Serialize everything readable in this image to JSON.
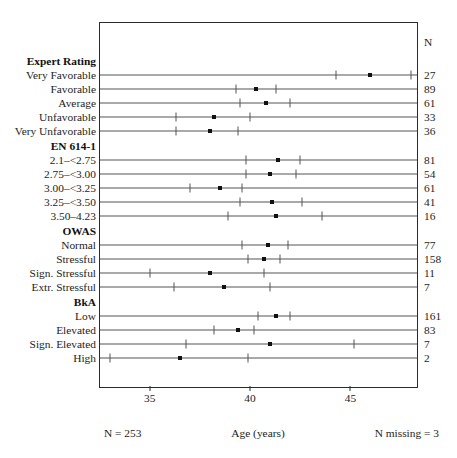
{
  "chart_data": {
    "type": "scatter",
    "title": "",
    "xlabel": "Age (years)",
    "ylabel": "",
    "xlim": [
      32.52,
      48.32
    ],
    "xticks": [
      35,
      40,
      45
    ],
    "xtick_labels": [
      "35",
      "40",
      "45"
    ],
    "grid": false,
    "legend": "none",
    "n_column_header": "N",
    "footer_left": "N = 253",
    "footer_center": "Age (years)",
    "footer_right": "N missing = 3",
    "marker": "point estimate with 95% confidence interval whiskers",
    "groups": [
      {
        "name": "Expert Rating",
        "rows": [
          {
            "label": "Very Favorable",
            "estimate": 46.0,
            "ci_low": 44.3,
            "ci_high": 48.0,
            "n": "27"
          },
          {
            "label": "Favorable",
            "estimate": 40.3,
            "ci_low": 39.3,
            "ci_high": 41.3,
            "n": "89"
          },
          {
            "label": "Average",
            "estimate": 40.8,
            "ci_low": 39.5,
            "ci_high": 42.0,
            "n": "61"
          },
          {
            "label": "Unfavorable",
            "estimate": 38.2,
            "ci_low": 36.3,
            "ci_high": 40.0,
            "n": "33"
          },
          {
            "label": "Very Unfavorable",
            "estimate": 38.0,
            "ci_low": 36.3,
            "ci_high": 39.4,
            "n": "36"
          }
        ]
      },
      {
        "name": "EN 614-1",
        "rows": [
          {
            "label": "2.1–<2.75",
            "estimate": 41.4,
            "ci_low": 39.8,
            "ci_high": 42.5,
            "n": "81"
          },
          {
            "label": "2.75–<3.00",
            "estimate": 41.0,
            "ci_low": 39.8,
            "ci_high": 42.3,
            "n": "54"
          },
          {
            "label": "3.00–<3.25",
            "estimate": 38.5,
            "ci_low": 37.0,
            "ci_high": 39.6,
            "n": "61"
          },
          {
            "label": "3.25–<3.50",
            "estimate": 41.1,
            "ci_low": 39.5,
            "ci_high": 42.6,
            "n": "41"
          },
          {
            "label": "3.50–4.23",
            "estimate": 41.3,
            "ci_low": 38.9,
            "ci_high": 43.6,
            "n": "16"
          }
        ]
      },
      {
        "name": "OWAS",
        "rows": [
          {
            "label": "Normal",
            "estimate": 40.9,
            "ci_low": 39.6,
            "ci_high": 41.9,
            "n": "77"
          },
          {
            "label": "Stressful",
            "estimate": 40.7,
            "ci_low": 39.9,
            "ci_high": 41.5,
            "n": "158"
          },
          {
            "label": "Sign. Stressful",
            "estimate": 38.0,
            "ci_low": 35.0,
            "ci_high": 40.7,
            "n": "11"
          },
          {
            "label": "Extr. Stressful",
            "estimate": 38.7,
            "ci_low": 36.2,
            "ci_high": 41.0,
            "n": "7"
          }
        ]
      },
      {
        "name": "BkA",
        "rows": [
          {
            "label": "Low",
            "estimate": 41.3,
            "ci_low": 40.4,
            "ci_high": 42.0,
            "n": "161"
          },
          {
            "label": "Elevated",
            "estimate": 39.4,
            "ci_low": 38.2,
            "ci_high": 40.2,
            "n": "83"
          },
          {
            "label": "Sign. Elevated",
            "estimate": 41.0,
            "ci_low": 36.8,
            "ci_high": 45.2,
            "n": "7"
          },
          {
            "label": "High",
            "estimate": 36.5,
            "ci_low": 33.0,
            "ci_high": 39.9,
            "n": "2"
          }
        ]
      }
    ]
  },
  "colors": {
    "frame": "#2b2b2b",
    "whisker": "#555555",
    "marker": "#111111",
    "text": "#1d1d1d",
    "background": "#ffffff"
  }
}
